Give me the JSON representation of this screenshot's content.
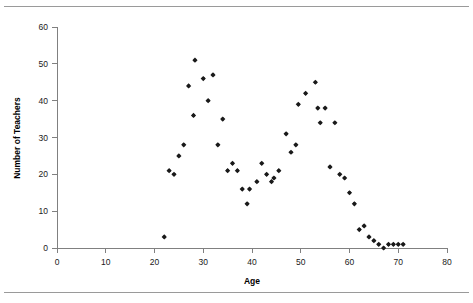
{
  "chart_data": {
    "type": "scatter",
    "title": "",
    "xlabel": "Age",
    "ylabel": "Number of Teachers",
    "xlim": [
      0,
      80
    ],
    "ylim": [
      0,
      60
    ],
    "xticks": [
      0,
      10,
      20,
      30,
      40,
      50,
      60,
      70,
      80
    ],
    "yticks": [
      0,
      10,
      20,
      30,
      40,
      50,
      60
    ],
    "grid": false,
    "legend": null,
    "marker": "diamond",
    "marker_color": "#1a1a1a",
    "series": [
      {
        "name": "Teachers by age",
        "points": [
          [
            22,
            3
          ],
          [
            23,
            21
          ],
          [
            24,
            20
          ],
          [
            25,
            25
          ],
          [
            26,
            28
          ],
          [
            27,
            44
          ],
          [
            28,
            36
          ],
          [
            28.3,
            51
          ],
          [
            30,
            46
          ],
          [
            31,
            40
          ],
          [
            32,
            47
          ],
          [
            33,
            28
          ],
          [
            34,
            35
          ],
          [
            35,
            21
          ],
          [
            36,
            23
          ],
          [
            37,
            21
          ],
          [
            38,
            16
          ],
          [
            39,
            12
          ],
          [
            39.5,
            16
          ],
          [
            41,
            18
          ],
          [
            42,
            23
          ],
          [
            43,
            20
          ],
          [
            44,
            18
          ],
          [
            44.5,
            19
          ],
          [
            45.5,
            21
          ],
          [
            47,
            31
          ],
          [
            48,
            26
          ],
          [
            49,
            28
          ],
          [
            49.5,
            39
          ],
          [
            51,
            42
          ],
          [
            53,
            45
          ],
          [
            53.5,
            38
          ],
          [
            54,
            34
          ],
          [
            55,
            38
          ],
          [
            57,
            34
          ],
          [
            56,
            22
          ],
          [
            58,
            20
          ],
          [
            59,
            19
          ],
          [
            60,
            15
          ],
          [
            61,
            12
          ],
          [
            62,
            5
          ],
          [
            63,
            6
          ],
          [
            64,
            3
          ],
          [
            65,
            2
          ],
          [
            66,
            1
          ],
          [
            67,
            0
          ],
          [
            68,
            1
          ],
          [
            69,
            1
          ],
          [
            70,
            1
          ],
          [
            71,
            1
          ]
        ]
      }
    ]
  },
  "axes": {
    "x_title": "Age",
    "y_title": "Number of Teachers",
    "x_tick_labels": [
      "0",
      "10",
      "20",
      "30",
      "40",
      "50",
      "60",
      "70",
      "80"
    ],
    "y_tick_labels": [
      "0",
      "10",
      "20",
      "30",
      "40",
      "50",
      "60"
    ]
  }
}
